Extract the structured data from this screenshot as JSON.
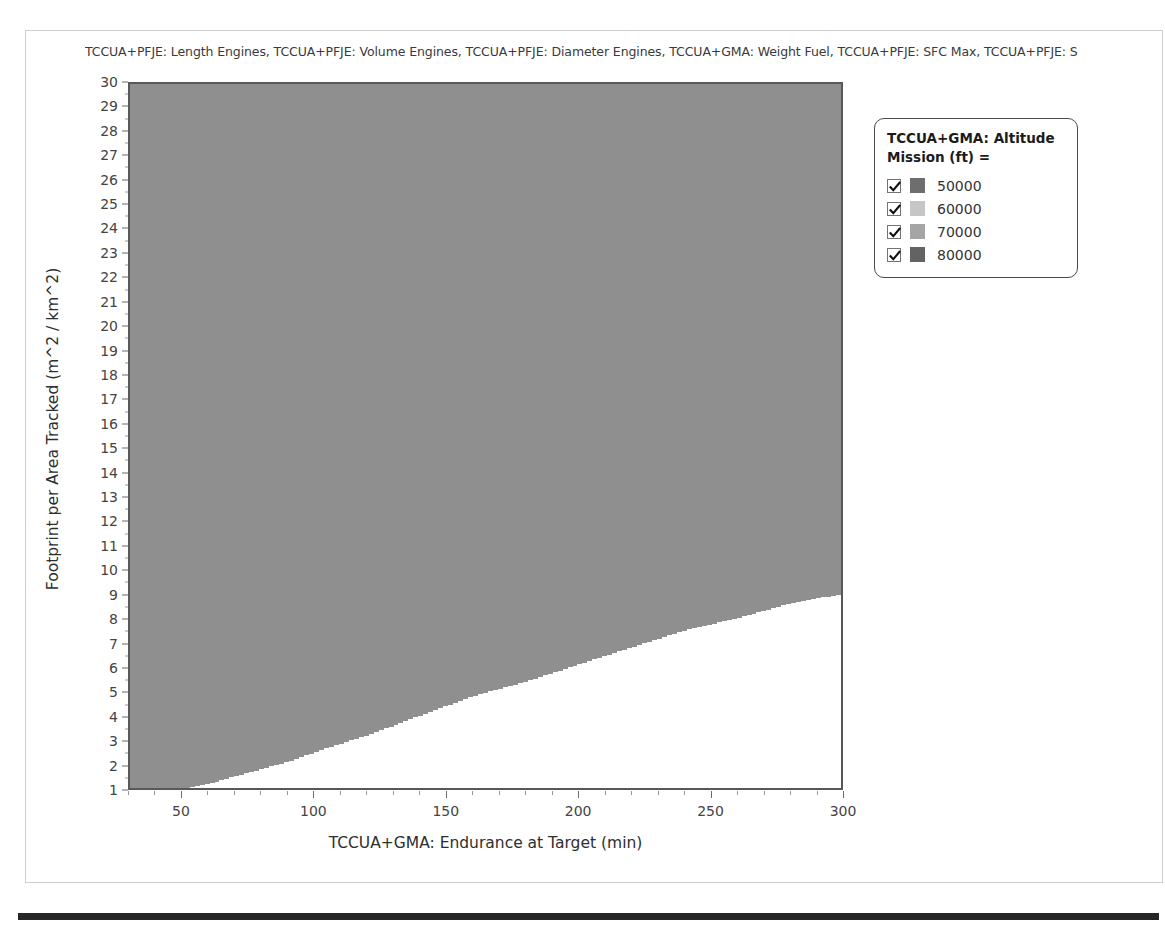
{
  "chart_data": {
    "type": "area",
    "title": "TCCUA+PFJE: Length Engines, TCCUA+PFJE: Volume Engines, TCCUA+PFJE: Diameter Engines, TCCUA+GMA: Weight Fuel, TCCUA+PFJE: SFC Max, TCCUA+PFJE: S",
    "xlabel": "TCCUA+GMA: Endurance at Target (min)",
    "ylabel": "Footprint per Area Tracked (m^2 / km^2)",
    "xlim": [
      30,
      300
    ],
    "ylim": [
      1,
      30
    ],
    "xticks": [
      50,
      100,
      150,
      200,
      250,
      300
    ],
    "yticks": [
      1,
      2,
      3,
      4,
      5,
      6,
      7,
      8,
      9,
      10,
      11,
      12,
      13,
      14,
      15,
      16,
      17,
      18,
      19,
      20,
      21,
      22,
      23,
      24,
      25,
      26,
      27,
      28,
      29,
      30
    ],
    "grid": false,
    "legend_position": "right",
    "series": [
      {
        "name": "50000",
        "color": "#808080",
        "checked": true,
        "boundary_x": [
          30,
          40,
          50,
          55,
          60,
          70,
          80,
          90,
          100,
          120,
          140,
          160,
          180,
          200,
          220,
          240,
          260,
          280,
          300
        ],
        "boundary_y": [
          1.0,
          1.0,
          1.0,
          1.1,
          1.2,
          1.5,
          1.8,
          2.1,
          2.5,
          3.2,
          4.0,
          4.8,
          5.4,
          6.1,
          6.8,
          7.5,
          8.0,
          8.6,
          9.0
        ]
      },
      {
        "name": "60000",
        "color": "#bdbdbd",
        "checked": true,
        "boundary_x": [
          30,
          40,
          50,
          55,
          60,
          70,
          80,
          90,
          100,
          120,
          140,
          160,
          180,
          200,
          220,
          240,
          260,
          280,
          300
        ],
        "boundary_y": [
          1.6,
          1.6,
          1.7,
          1.9,
          2.2,
          2.8,
          3.4,
          4.1,
          4.8,
          6.3,
          7.8,
          9.3,
          10.8,
          12.4,
          14.0,
          15.8,
          17.6,
          19.7,
          22.0
        ]
      },
      {
        "name": "70000",
        "color": "#a8a8a8",
        "checked": true,
        "boundary_x": [
          30,
          40,
          50,
          55,
          60,
          70,
          80,
          90,
          100,
          120,
          140,
          160,
          180,
          200,
          220,
          240,
          260,
          280,
          300
        ],
        "boundary_y": [
          3.1,
          3.1,
          3.2,
          3.7,
          4.3,
          5.5,
          6.8,
          8.2,
          9.6,
          12.6,
          15.6,
          18.4,
          21.2,
          24.0,
          26.6,
          28.8,
          30.0,
          30.0,
          30.0
        ]
      },
      {
        "name": "80000",
        "color": "#6e6e6e",
        "checked": true
      }
    ]
  },
  "legend": {
    "title": "TCCUA+GMA: Altitude\nMission (ft) =",
    "title_line1": "TCCUA+GMA: Altitude",
    "title_line2": "Mission (ft) =",
    "items": [
      {
        "label": "50000",
        "color": "#6e6e6e",
        "checked": true
      },
      {
        "label": "60000",
        "color": "#c6c6c6",
        "checked": true
      },
      {
        "label": "70000",
        "color": "#a5a5a5",
        "checked": true
      },
      {
        "label": "80000",
        "color": "#636363",
        "checked": true
      }
    ]
  },
  "colors": {
    "plot_border": "#585858",
    "page_border": "#cfcfcf",
    "bottom_rule": "#262626",
    "band_50000": "#a4a4a4",
    "band_60000": "#cfcfcf",
    "band_70000": "#bcbcbc",
    "band_80000": "#8f8f8f",
    "plot_background": "#ffffff"
  }
}
